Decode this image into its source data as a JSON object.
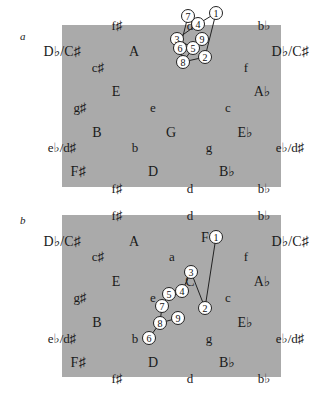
{
  "figure": {
    "panels": [
      {
        "id": "a",
        "label": "a",
        "labels": [
          {
            "text": "f♯",
            "x": 117,
            "y": 25,
            "size": "min"
          },
          {
            "text": "d",
            "x": 190,
            "y": 25,
            "size": "min"
          },
          {
            "text": "b♭",
            "x": 264,
            "y": 25,
            "size": "min"
          },
          {
            "text": "D♭/C♯",
            "x": 62,
            "y": 52,
            "size": "maj"
          },
          {
            "text": "A",
            "x": 134,
            "y": 52,
            "size": "maj"
          },
          {
            "text": "D♭/C♯",
            "x": 290,
            "y": 52,
            "size": "maj"
          },
          {
            "text": "c♯",
            "x": 98,
            "y": 67,
            "size": "min"
          },
          {
            "text": "f",
            "x": 246,
            "y": 67,
            "size": "min"
          },
          {
            "text": "E",
            "x": 116,
            "y": 92,
            "size": "maj"
          },
          {
            "text": "A♭",
            "x": 262,
            "y": 92,
            "size": "maj"
          },
          {
            "text": "g♯",
            "x": 80,
            "y": 107,
            "size": "min"
          },
          {
            "text": "e",
            "x": 153,
            "y": 107,
            "size": "min"
          },
          {
            "text": "c",
            "x": 228,
            "y": 107,
            "size": "min"
          },
          {
            "text": "B",
            "x": 97,
            "y": 133,
            "size": "maj"
          },
          {
            "text": "G",
            "x": 171,
            "y": 133,
            "size": "maj"
          },
          {
            "text": "E♭",
            "x": 245,
            "y": 133,
            "size": "maj"
          },
          {
            "text": "e♭/d♯",
            "x": 62,
            "y": 147,
            "size": "min"
          },
          {
            "text": "b",
            "x": 135,
            "y": 147,
            "size": "min"
          },
          {
            "text": "g",
            "x": 209,
            "y": 147,
            "size": "min"
          },
          {
            "text": "e♭/d♯",
            "x": 290,
            "y": 147,
            "size": "min"
          },
          {
            "text": "F♯",
            "x": 78,
            "y": 172,
            "size": "maj"
          },
          {
            "text": "D",
            "x": 153,
            "y": 172,
            "size": "maj"
          },
          {
            "text": "B♭",
            "x": 227,
            "y": 172,
            "size": "maj"
          },
          {
            "text": "f♯",
            "x": 117,
            "y": 188,
            "size": "min"
          },
          {
            "text": "d",
            "x": 190,
            "y": 188,
            "size": "min"
          },
          {
            "text": "b♭",
            "x": 264,
            "y": 188,
            "size": "min"
          }
        ],
        "nodes": [
          {
            "n": "1",
            "x": 216,
            "y": 13
          },
          {
            "n": "2",
            "x": 205,
            "y": 57
          },
          {
            "n": "3",
            "x": 177,
            "y": 39
          },
          {
            "n": "4",
            "x": 198,
            "y": 24
          },
          {
            "n": "5",
            "x": 193,
            "y": 48
          },
          {
            "n": "6",
            "x": 180,
            "y": 48
          },
          {
            "n": "7",
            "x": 188,
            "y": 16
          },
          {
            "n": "8",
            "x": 183,
            "y": 62
          },
          {
            "n": "9",
            "x": 202,
            "y": 39
          }
        ],
        "edges": [
          [
            "1",
            "2"
          ],
          [
            "2",
            "8"
          ],
          [
            "8",
            "6"
          ],
          [
            "6",
            "7"
          ],
          [
            "7",
            "4"
          ],
          [
            "4",
            "3"
          ],
          [
            "3",
            "5"
          ],
          [
            "5",
            "8"
          ],
          [
            "4",
            "1"
          ],
          [
            "9",
            "5"
          ]
        ],
        "offset_y": 0
      },
      {
        "id": "b",
        "label": "b",
        "labels": [
          {
            "text": "f♯",
            "x": 117,
            "y": 215,
            "size": "min"
          },
          {
            "text": "d",
            "x": 190,
            "y": 215,
            "size": "min"
          },
          {
            "text": "b♭",
            "x": 264,
            "y": 215,
            "size": "min"
          },
          {
            "text": "D♭/C♯",
            "x": 62,
            "y": 242,
            "size": "maj"
          },
          {
            "text": "A",
            "x": 134,
            "y": 242,
            "size": "maj"
          },
          {
            "text": "F",
            "x": 205,
            "y": 238,
            "size": "maj"
          },
          {
            "text": "D♭/C♯",
            "x": 290,
            "y": 242,
            "size": "maj"
          },
          {
            "text": "c♯",
            "x": 98,
            "y": 256,
            "size": "min"
          },
          {
            "text": "a",
            "x": 172,
            "y": 256,
            "size": "min"
          },
          {
            "text": "f",
            "x": 246,
            "y": 256,
            "size": "min"
          },
          {
            "text": "E",
            "x": 116,
            "y": 282,
            "size": "maj"
          },
          {
            "text": "C",
            "x": 190,
            "y": 282,
            "size": "maj"
          },
          {
            "text": "A♭",
            "x": 262,
            "y": 282,
            "size": "maj"
          },
          {
            "text": "g♯",
            "x": 80,
            "y": 297,
            "size": "min"
          },
          {
            "text": "e",
            "x": 153,
            "y": 297,
            "size": "min"
          },
          {
            "text": "c",
            "x": 228,
            "y": 297,
            "size": "min"
          },
          {
            "text": "B",
            "x": 97,
            "y": 323,
            "size": "maj"
          },
          {
            "text": "E♭",
            "x": 245,
            "y": 323,
            "size": "maj"
          },
          {
            "text": "e♭/d♯",
            "x": 62,
            "y": 338,
            "size": "min"
          },
          {
            "text": "b",
            "x": 135,
            "y": 338,
            "size": "min"
          },
          {
            "text": "g",
            "x": 209,
            "y": 338,
            "size": "min"
          },
          {
            "text": "e♭/d♯",
            "x": 290,
            "y": 338,
            "size": "min"
          },
          {
            "text": "F♯",
            "x": 78,
            "y": 363,
            "size": "maj"
          },
          {
            "text": "D",
            "x": 153,
            "y": 363,
            "size": "maj"
          },
          {
            "text": "B♭",
            "x": 227,
            "y": 363,
            "size": "maj"
          },
          {
            "text": "f♯",
            "x": 117,
            "y": 378,
            "size": "min"
          },
          {
            "text": "d",
            "x": 190,
            "y": 378,
            "size": "min"
          },
          {
            "text": "b♭",
            "x": 264,
            "y": 378,
            "size": "min"
          }
        ],
        "nodes": [
          {
            "n": "1",
            "x": 216,
            "y": 237
          },
          {
            "n": "2",
            "x": 205,
            "y": 308
          },
          {
            "n": "3",
            "x": 191,
            "y": 272
          },
          {
            "n": "4",
            "x": 182,
            "y": 291
          },
          {
            "n": "5",
            "x": 169,
            "y": 294
          },
          {
            "n": "6",
            "x": 149,
            "y": 338
          },
          {
            "n": "7",
            "x": 162,
            "y": 306
          },
          {
            "n": "8",
            "x": 160,
            "y": 323
          },
          {
            "n": "9",
            "x": 178,
            "y": 318
          }
        ],
        "edges": [
          [
            "1",
            "2"
          ],
          [
            "2",
            "3"
          ],
          [
            "3",
            "4"
          ],
          [
            "4",
            "5"
          ],
          [
            "5",
            "7"
          ],
          [
            "7",
            "8"
          ],
          [
            "8",
            "6"
          ],
          [
            "8",
            "9"
          ]
        ],
        "offset_y": 0
      }
    ]
  }
}
